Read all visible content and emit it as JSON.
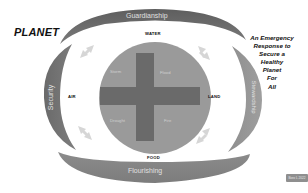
{
  "diagram": {
    "title": "PLANET",
    "tagline_lines": [
      "An Emergency",
      "Response to",
      "Secure a",
      "Healthy",
      "Planet",
      "For",
      "All"
    ],
    "arcs": {
      "top": "Guardianship",
      "left": "Security",
      "right": "Stewardship",
      "bottom": "Flourishing"
    },
    "elements": {
      "top": "WATER",
      "left": "AIR",
      "right": "LAND",
      "bottom": "FOOD"
    },
    "quadrants": {
      "top_left": "Storm",
      "top_right": "Flood",
      "bottom_left": "Drought",
      "bottom_right": "Fire"
    },
    "badge": "Boro L 2022",
    "colors": {
      "arc_dark": "#6e6e6e",
      "arc_mid": "#8a8a8a",
      "disc": "#9a9a9a",
      "cross": "#6a6a6a",
      "arrow": "#d4d4d4",
      "text": "#111111"
    }
  }
}
